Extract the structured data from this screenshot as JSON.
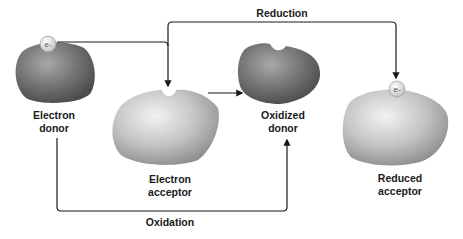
{
  "labels": {
    "electron_donor": [
      "Electron",
      "donor"
    ],
    "electron_acceptor": [
      "Electron",
      "acceptor"
    ],
    "oxidized_donor": [
      "Oxidized",
      "donor"
    ],
    "reduced_acceptor": [
      "Reduced",
      "acceptor"
    ],
    "reduction": "Reduction",
    "oxidation": "Oxidation",
    "electron_symbol": "e-"
  },
  "colors": {
    "arrow": "#1a1a1a",
    "donor_dark": "#5a5a5a",
    "donor_light": "#9a9a9a",
    "acceptor_dark": "#8a8a8a",
    "acceptor_light": "#e8e8e8"
  }
}
